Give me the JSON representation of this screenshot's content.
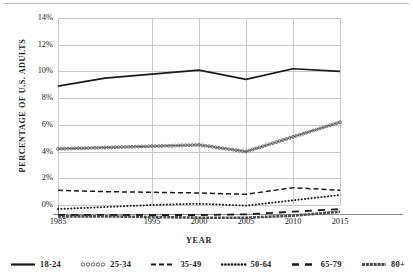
{
  "chart_data": {
    "type": "line",
    "title": "",
    "xlabel": "YEAR",
    "ylabel": "PERCENTAGE OF U.S. ADULTS",
    "x": [
      1985,
      1990,
      1995,
      2000,
      2005,
      2010,
      2015
    ],
    "xtick_labels": [
      "1985",
      "1995",
      "2000",
      "2005",
      "2010",
      "2015"
    ],
    "xtick_values": [
      1985,
      1995,
      2000,
      2005,
      2010,
      2015
    ],
    "ytick_labels": [
      "14%",
      "12%",
      "10%",
      "8%",
      "6%",
      "4%",
      "2%",
      "0%"
    ],
    "ytick_values": [
      14,
      12,
      10,
      8,
      6,
      4,
      2,
      0
    ],
    "xlim": [
      1985,
      2015
    ],
    "ylim": [
      -1.0,
      14
    ],
    "grid": "both",
    "legend_position": "bottom",
    "series": [
      {
        "name": "18-24",
        "style": "solid",
        "color": "#1a1a1a",
        "values": [
          8.9,
          9.5,
          9.8,
          10.1,
          9.4,
          10.2,
          10.0
        ]
      },
      {
        "name": "25-34",
        "style": "circle-markers",
        "color": "#555555",
        "values": [
          4.2,
          4.3,
          4.4,
          4.5,
          4.0,
          5.1,
          6.2
        ]
      },
      {
        "name": "35-49",
        "style": "dashed",
        "color": "#1a1a1a",
        "values": [
          1.1,
          1.0,
          0.95,
          0.9,
          0.8,
          1.3,
          1.1
        ]
      },
      {
        "name": "50-64",
        "style": "dotted",
        "color": "#1a1a1a",
        "values": [
          -0.3,
          -0.15,
          0.0,
          0.1,
          -0.05,
          0.35,
          0.75
        ]
      },
      {
        "name": "65-79",
        "style": "long-dash",
        "color": "#1a1a1a",
        "values": [
          -0.75,
          -0.75,
          -0.75,
          -0.75,
          -0.7,
          -0.5,
          -0.3
        ]
      },
      {
        "name": "80+",
        "style": "thick-solid",
        "color": "#4a4a4a",
        "values": [
          -0.85,
          -0.85,
          -0.9,
          -0.95,
          -0.95,
          -0.8,
          -0.5
        ]
      }
    ]
  },
  "axes": {
    "y_title": "PERCENTAGE OF U.S. ADULTS",
    "x_title": "YEAR"
  },
  "legend": {
    "items": [
      {
        "label": "18-24"
      },
      {
        "label": "25-34"
      },
      {
        "label": "35-49"
      },
      {
        "label": "50-64"
      },
      {
        "label": "65-79"
      },
      {
        "label": "80+"
      }
    ]
  }
}
